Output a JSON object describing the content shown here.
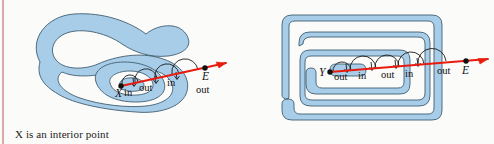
{
  "figure": {
    "background_color": "#fbfbf9",
    "edge_strip_color": "#d8a9a6",
    "region_fill_color": "#a8cde8",
    "region_stroke_color": "#3f5d72",
    "ray_color": "#e81c0e",
    "label_color": "#111111"
  },
  "panels": [
    {
      "id": "left",
      "shape_type": "curved-spiral-blob",
      "caption": "X is an interior point",
      "point_label": "X",
      "endpoint_label": "E",
      "crossing_labels": [
        "in",
        "out",
        "in",
        "out"
      ],
      "labels": [
        {
          "text": "X",
          "x": 119,
          "y": 92,
          "style": "point"
        },
        {
          "text": "in",
          "x": 128,
          "y": 93,
          "style": "crossing"
        },
        {
          "text": "out",
          "x": 146,
          "y": 88,
          "style": "crossing"
        },
        {
          "text": "in",
          "x": 173,
          "y": 83,
          "style": "crossing"
        },
        {
          "text": "E",
          "x": 205,
          "y": 76,
          "style": "point"
        },
        {
          "text": "out",
          "x": 202,
          "y": 90,
          "style": "crossing"
        }
      ]
    },
    {
      "id": "right",
      "shape_type": "rectangular-spiral",
      "caption": "Y is an exterior point",
      "point_label": "Y",
      "endpoint_label": "E",
      "crossing_labels": [
        "out",
        "in",
        "out",
        "in",
        "out"
      ],
      "labels": [
        {
          "text": "Y",
          "x": 323,
          "y": 78,
          "style": "point"
        },
        {
          "text": "out",
          "x": 344,
          "y": 80,
          "style": "crossing"
        },
        {
          "text": "in",
          "x": 366,
          "y": 79,
          "style": "crossing"
        },
        {
          "text": "out",
          "x": 390,
          "y": 78,
          "style": "crossing"
        },
        {
          "text": "in",
          "x": 412,
          "y": 77,
          "style": "crossing"
        },
        {
          "text": "out",
          "x": 444,
          "y": 74,
          "style": "crossing"
        },
        {
          "text": "E",
          "x": 466,
          "y": 74,
          "style": "point"
        }
      ]
    }
  ]
}
